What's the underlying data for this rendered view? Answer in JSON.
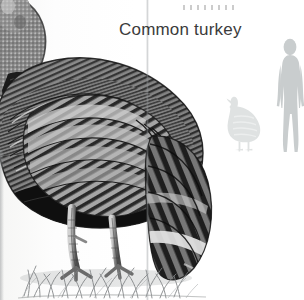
{
  "page": {
    "kind": "scanned field-guide page",
    "background_color": "#ffffff",
    "gutter_shadow_color": "#969a9d"
  },
  "heading": {
    "title": "Common turkey",
    "color": "#3b3b3b",
    "font_size_px": 17
  },
  "illustration": {
    "subject": "turkey-illustration",
    "description": "Grayscale rendering of a common turkey with barred plumage, standing on grass, head cropped at upper-left, drooping barred tail at right",
    "ink_dark": "#1c1c1c",
    "ink_mid": "#6e6e6e",
    "ink_light": "#b9b9b9",
    "ground_color": "#8d9091"
  },
  "scale_comparison": {
    "label": "size-comparison-silhouettes",
    "human": {
      "name": "human-silhouette",
      "color": "#c9cdce",
      "height_px": 112
    },
    "turkey": {
      "name": "turkey-silhouette",
      "color": "#dfe2e2",
      "height_px": 52
    }
  }
}
